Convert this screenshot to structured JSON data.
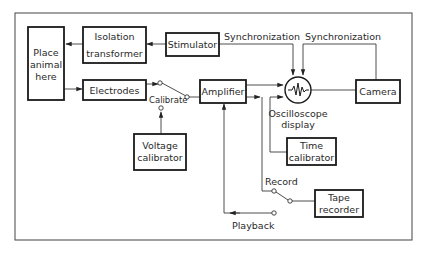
{
  "diagram": {
    "nodes": {
      "place_animal": {
        "line1": "Place",
        "line2": "animal",
        "line3": "here"
      },
      "isolation_transformer": {
        "line1": "Isolation",
        "line2": "transformer"
      },
      "stimulator": {
        "label": "Stimulator"
      },
      "electrodes": {
        "label": "Electrodes"
      },
      "voltage_calibrator": {
        "line1": "Voltage",
        "line2": "calibrator"
      },
      "amplifier": {
        "label": "Amplifier"
      },
      "oscilloscope": {
        "line1": "Oscilloscope",
        "line2": "display"
      },
      "camera": {
        "label": "Camera"
      },
      "time_calibrator": {
        "line1": "Time",
        "line2": "calibrator"
      },
      "tape_recorder": {
        "line1": "Tape",
        "line2": "recorder"
      }
    },
    "labels": {
      "sync_stimulator": "Synchronization",
      "sync_camera": "Synchronization",
      "calibrate": "Calibrate",
      "record": "Record",
      "playback": "Playback"
    },
    "edges": [
      {
        "from": "stimulator",
        "to": "isolation_transformer"
      },
      {
        "from": "isolation_transformer",
        "to": "place_animal"
      },
      {
        "from": "place_animal",
        "to": "electrodes"
      },
      {
        "from": "electrodes",
        "to": "calibrate_switch"
      },
      {
        "from": "voltage_calibrator",
        "to": "calibrate_switch"
      },
      {
        "from": "calibrate_switch",
        "to": "amplifier"
      },
      {
        "from": "amplifier",
        "to": "oscilloscope"
      },
      {
        "from": "stimulator",
        "to": "oscilloscope",
        "label": "Synchronization"
      },
      {
        "from": "camera",
        "to": "oscilloscope",
        "label": "Synchronization"
      },
      {
        "from": "oscilloscope",
        "to": "camera"
      },
      {
        "from": "time_calibrator",
        "to": "oscilloscope"
      },
      {
        "from": "amplifier",
        "to": "record_switch",
        "label": "Record"
      },
      {
        "from": "record_switch",
        "to": "tape_recorder"
      },
      {
        "from": "playback_terminal",
        "to": "amplifier",
        "label": "Playback"
      }
    ]
  }
}
